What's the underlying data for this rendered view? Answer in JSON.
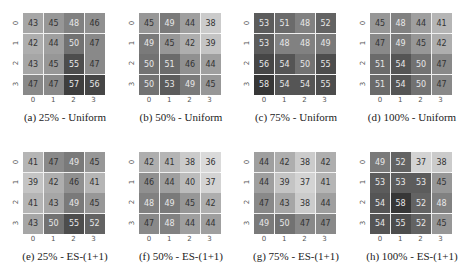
{
  "chart_data": [
    {
      "type": "heatmap",
      "id": "a",
      "title": "(a) 25% - Uniform",
      "x_ticks": [
        "0",
        "1",
        "2",
        "3"
      ],
      "y_ticks": [
        "0",
        "1",
        "2",
        "3"
      ],
      "values": [
        [
          43,
          45,
          48,
          46
        ],
        [
          42,
          44,
          50,
          47
        ],
        [
          43,
          45,
          55,
          47
        ],
        [
          47,
          47,
          57,
          56
        ]
      ]
    },
    {
      "type": "heatmap",
      "id": "b",
      "title": "(b) 50% - Uniform",
      "x_ticks": [
        "0",
        "1",
        "2",
        "3"
      ],
      "y_ticks": [
        "0",
        "1",
        "2",
        "3"
      ],
      "values": [
        [
          45,
          49,
          44,
          38
        ],
        [
          49,
          45,
          42,
          39
        ],
        [
          50,
          51,
          46,
          44
        ],
        [
          50,
          53,
          49,
          45
        ]
      ]
    },
    {
      "type": "heatmap",
      "id": "c",
      "title": "(c) 75% - Uniform",
      "x_ticks": [
        "0",
        "1",
        "2",
        "3"
      ],
      "y_ticks": [
        "0",
        "1",
        "2",
        "3"
      ],
      "values": [
        [
          53,
          51,
          48,
          52
        ],
        [
          53,
          48,
          48,
          49
        ],
        [
          56,
          54,
          50,
          55
        ],
        [
          58,
          54,
          54,
          55
        ]
      ]
    },
    {
      "type": "heatmap",
      "id": "d",
      "title": "(d) 100% - Uniform",
      "x_ticks": [
        "0",
        "1",
        "2",
        "3"
      ],
      "y_ticks": [
        "0",
        "1",
        "2",
        "3"
      ],
      "values": [
        [
          45,
          48,
          44,
          41
        ],
        [
          47,
          49,
          45,
          42
        ],
        [
          51,
          54,
          50,
          47
        ],
        [
          51,
          54,
          50,
          47
        ]
      ]
    },
    {
      "type": "heatmap",
      "id": "e",
      "title": "(e) 25% - ES-(1+1)",
      "x_ticks": [
        "0",
        "1",
        "2",
        "3"
      ],
      "y_ticks": [
        "0",
        "1",
        "2",
        "3"
      ],
      "values": [
        [
          41,
          47,
          49,
          45
        ],
        [
          39,
          42,
          46,
          41
        ],
        [
          41,
          43,
          49,
          45
        ],
        [
          43,
          50,
          55,
          52
        ]
      ]
    },
    {
      "type": "heatmap",
      "id": "f",
      "title": "(f) 50% - ES-(1+1)",
      "x_ticks": [
        "0",
        "1",
        "2",
        "3"
      ],
      "y_ticks": [
        "0",
        "1",
        "2",
        "3"
      ],
      "values": [
        [
          42,
          41,
          38,
          36
        ],
        [
          46,
          44,
          40,
          37
        ],
        [
          48,
          49,
          45,
          42
        ],
        [
          47,
          48,
          44,
          44
        ]
      ]
    },
    {
      "type": "heatmap",
      "id": "g",
      "title": "(g) 75% - ES-(1+1)",
      "x_ticks": [
        "0",
        "1",
        "2",
        "3"
      ],
      "y_ticks": [
        "0",
        "1",
        "2",
        "3"
      ],
      "values": [
        [
          44,
          42,
          38,
          42
        ],
        [
          44,
          39,
          37,
          41
        ],
        [
          47,
          43,
          38,
          44
        ],
        [
          49,
          50,
          47,
          47
        ]
      ]
    },
    {
      "type": "heatmap",
      "id": "h",
      "title": "(h) 100% - ES-(1+1)",
      "x_ticks": [
        "0",
        "1",
        "2",
        "3"
      ],
      "y_ticks": [
        "0",
        "1",
        "2",
        "3"
      ],
      "values": [
        [
          49,
          52,
          37,
          38
        ],
        [
          53,
          53,
          53,
          45
        ],
        [
          54,
          58,
          52,
          48
        ],
        [
          54,
          55,
          52,
          45
        ]
      ]
    }
  ],
  "layout": {
    "colormap": "grayscale (darker = higher)",
    "value_range": [
      36,
      58
    ],
    "panels_per_row": 4,
    "rows": 2
  }
}
